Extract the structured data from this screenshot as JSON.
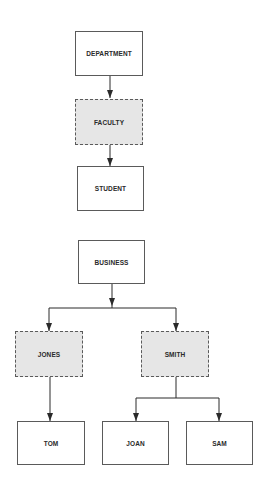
{
  "diagram": {
    "top_chart": {
      "nodes": [
        {
          "id": "department",
          "label": "DEPARTMENT",
          "style": "solid"
        },
        {
          "id": "faculty",
          "label": "FACULTY",
          "style": "dashed"
        },
        {
          "id": "student",
          "label": "STUDENT",
          "style": "solid"
        }
      ],
      "edges": [
        {
          "from": "department",
          "to": "faculty"
        },
        {
          "from": "faculty",
          "to": "student"
        }
      ]
    },
    "bottom_chart": {
      "nodes": [
        {
          "id": "business",
          "label": "BUSINESS",
          "style": "solid"
        },
        {
          "id": "jones",
          "label": "JONES",
          "style": "dashed"
        },
        {
          "id": "smith",
          "label": "SMITH",
          "style": "dashed"
        },
        {
          "id": "tom",
          "label": "TOM",
          "style": "solid"
        },
        {
          "id": "joan",
          "label": "JOAN",
          "style": "solid"
        },
        {
          "id": "sam",
          "label": "SAM",
          "style": "solid"
        }
      ],
      "edges": [
        {
          "from": "business",
          "to": "jones"
        },
        {
          "from": "business",
          "to": "smith"
        },
        {
          "from": "jones",
          "to": "tom"
        },
        {
          "from": "smith",
          "to": "joan"
        },
        {
          "from": "smith",
          "to": "sam"
        }
      ]
    },
    "colors": {
      "line": "#2a2a2a",
      "border": "#5a5a5a",
      "dashed_fill": "#e6e6e6",
      "solid_fill": "#ffffff"
    }
  }
}
